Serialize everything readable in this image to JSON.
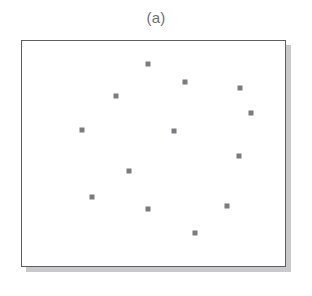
{
  "figure": {
    "caption": "(a)",
    "panel_label": "a"
  },
  "colors": {
    "marker": "#7b7b82",
    "frame": "#5d5d64",
    "shadow": "#c9c9c9",
    "background": "#ffffff",
    "caption_text": "#6f6f6f"
  },
  "plot_frame": {
    "x": 21,
    "y": 40,
    "width": 265,
    "height": 227,
    "shadow_offset_x": 5,
    "shadow_offset_y": 5
  },
  "chart_data": {
    "type": "scatter",
    "title": "(a)",
    "xlabel": "",
    "ylabel": "",
    "xlim": [
      0,
      100
    ],
    "ylim": [
      0,
      100
    ],
    "grid": false,
    "legend": null,
    "axis_ticks": {
      "x": [],
      "y": []
    },
    "marker": {
      "shape": "square",
      "size_px": 5,
      "color": "#7b7b82",
      "filled": true
    },
    "n_points": 13,
    "note": "Uniformly scattered point pattern; no axes ticks or labels drawn.",
    "series": [
      {
        "name": "points",
        "points": [
          {
            "x": 47.5,
            "y": 89.9,
            "px": 147,
            "py": 63
          },
          {
            "x": 61.5,
            "y": 82.0,
            "px": 184,
            "py": 81
          },
          {
            "x": 82.3,
            "y": 79.3,
            "px": 239,
            "py": 87
          },
          {
            "x": 35.5,
            "y": 75.8,
            "px": 115,
            "py": 95
          },
          {
            "x": 22.6,
            "y": 60.8,
            "px": 81,
            "py": 129
          },
          {
            "x": 57.4,
            "y": 60.4,
            "px": 173,
            "py": 130
          },
          {
            "x": 81.9,
            "y": 49.3,
            "px": 238,
            "py": 155
          },
          {
            "x": 40.4,
            "y": 42.7,
            "px": 128,
            "py": 170
          },
          {
            "x": 26.4,
            "y": 31.3,
            "px": 91,
            "py": 196
          },
          {
            "x": 47.5,
            "y": 26.0,
            "px": 147,
            "py": 208
          },
          {
            "x": 77.4,
            "y": 27.3,
            "px": 226,
            "py": 205
          },
          {
            "x": 65.3,
            "y": 15.4,
            "px": 194,
            "py": 232
          },
          {
            "x": 86.4,
            "y": 68.3,
            "px": 250,
            "py": 112
          }
        ]
      }
    ]
  }
}
